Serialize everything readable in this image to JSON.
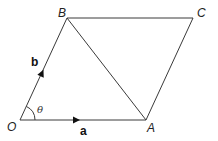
{
  "diagram": {
    "type": "parallelogram-vectors",
    "points": {
      "O": {
        "label": "O",
        "x": 20,
        "y": 120
      },
      "A": {
        "label": "A",
        "x": 146,
        "y": 120
      },
      "B": {
        "label": "B",
        "x": 67,
        "y": 18
      },
      "C": {
        "label": "C",
        "x": 193,
        "y": 18
      }
    },
    "edges": [
      {
        "from": "O",
        "to": "A"
      },
      {
        "from": "O",
        "to": "B"
      },
      {
        "from": "B",
        "to": "C"
      },
      {
        "from": "A",
        "to": "C"
      },
      {
        "from": "B",
        "to": "A"
      }
    ],
    "vectors": {
      "a": {
        "label": "a",
        "along": "OA"
      },
      "b": {
        "label": "b",
        "along": "OB"
      }
    },
    "angle": {
      "label": "θ",
      "at": "O",
      "between": [
        "OA",
        "OB"
      ]
    },
    "colors": {
      "line": "#3a3a3a",
      "text": "#222222"
    }
  }
}
